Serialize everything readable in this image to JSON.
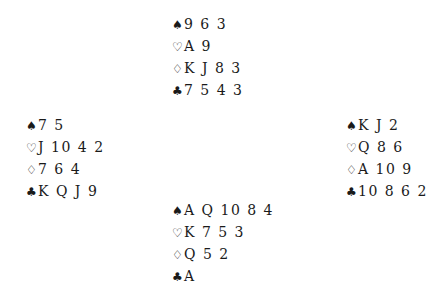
{
  "glyphs": {
    "spades": "♠",
    "hearts": "♡",
    "diamonds": "♢",
    "clubs": "♣"
  },
  "hands": {
    "north": {
      "spades": "9 6 3",
      "hearts": "A 9",
      "diamonds": "K J 8 3",
      "clubs": "7 5 4 3"
    },
    "west": {
      "spades": "7 5",
      "hearts": "J 10 4 2",
      "diamonds": "7 6 4",
      "clubs": "K Q J 9"
    },
    "east": {
      "spades": "K J 2",
      "hearts": "Q 8 6",
      "diamonds": "A 10 9",
      "clubs": "10 8 6 2"
    },
    "south": {
      "spades": "A Q 10 8 4",
      "hearts": "K 7 5 3",
      "diamonds": "Q 5 2",
      "clubs": "A"
    }
  }
}
